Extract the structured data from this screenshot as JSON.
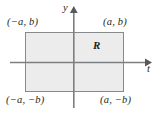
{
  "figure": {
    "type": "coordinate-plane-diagram",
    "background_color": "#ffffff",
    "axes": {
      "horizontal": {
        "label": "t",
        "name": "t-axis",
        "y_pixel": 62,
        "x_start": 10,
        "x_end": 151,
        "arrow": "right",
        "color": "#6d6e71"
      },
      "vertical": {
        "label": "y",
        "name": "y-axis",
        "x_pixel": 74,
        "y_start": 8,
        "y_end": 108,
        "arrow": "up",
        "color": "#6d6e71"
      }
    },
    "region": {
      "label": "R",
      "fill_color": "#ececec",
      "stroke_color": "#808285",
      "x": 25,
      "y": 32,
      "width": 99,
      "height": 60
    },
    "corner_labels": {
      "top_left": "(−a, b)",
      "top_right": "(a, b)",
      "bottom_left": "(−a, −b)",
      "bottom_right": "(a, −b)"
    }
  }
}
